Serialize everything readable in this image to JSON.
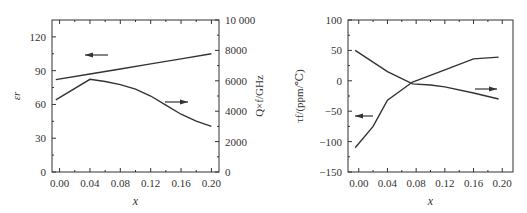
{
  "chart_data": [
    {
      "type": "line",
      "title": "",
      "xlabel": "x",
      "ylabel": "εr",
      "y2label": "Q×f/GHz",
      "xticks": [
        "0.00",
        "0.04",
        "0.08",
        "0.12",
        "0.16",
        "0.20"
      ],
      "yticks": [
        "0",
        "30",
        "60",
        "90",
        "120"
      ],
      "y2ticks": [
        "0",
        "2000",
        "4000",
        "6000",
        "8000",
        "10 000"
      ],
      "xlim": [
        -0.01,
        0.21
      ],
      "ylim": [
        0,
        135
      ],
      "y2lim": [
        0,
        10000
      ],
      "grid": false,
      "series": [
        {
          "name": "εr",
          "axis": "left",
          "x": [
            -0.005,
            0.04,
            0.08,
            0.12,
            0.16,
            0.2
          ],
          "values": [
            82,
            87,
            91.5,
            96,
            100.5,
            105
          ],
          "arrow": "left"
        },
        {
          "name": "Q×f",
          "axis": "right",
          "x": [
            -0.005,
            0.04,
            0.06,
            0.08,
            0.1,
            0.12,
            0.14,
            0.16,
            0.18,
            0.2
          ],
          "values": [
            4750,
            6100,
            5950,
            5750,
            5450,
            5000,
            4400,
            3800,
            3350,
            3000
          ],
          "arrow": "right"
        }
      ]
    },
    {
      "type": "line",
      "title": "",
      "xlabel": "x",
      "ylabel": "τf/(ppm/℃)",
      "xticks": [
        "0.00",
        "0.04",
        "0.08",
        "0.12",
        "0.16",
        "0.20"
      ],
      "yticks": [
        "-150",
        "-100",
        "-50",
        "0",
        "50",
        "100"
      ],
      "xlim": [
        -0.015,
        0.215
      ],
      "ylim": [
        -150,
        100
      ],
      "grid": false,
      "series": [
        {
          "name": "series-a (arrow left)",
          "x": [
            -0.005,
            0.02,
            0.04,
            0.075,
            0.12,
            0.16,
            0.195
          ],
          "values": [
            -110,
            -75,
            -32,
            -2,
            18,
            36,
            39
          ],
          "arrow": "left"
        },
        {
          "name": "series-b (arrow right)",
          "x": [
            -0.005,
            0.04,
            0.075,
            0.1,
            0.12,
            0.16,
            0.195
          ],
          "values": [
            50,
            15,
            -5,
            -7,
            -10,
            -20,
            -30
          ],
          "arrow": "right"
        }
      ]
    }
  ]
}
